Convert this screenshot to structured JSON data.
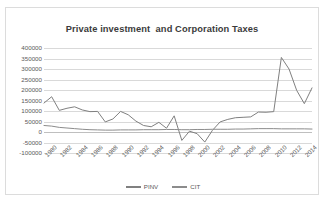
{
  "chart_data": {
    "type": "line",
    "title": "Private investment  and Corporation Taxes",
    "xlabel": "",
    "ylabel": "",
    "ylim": [
      -100000,
      400000
    ],
    "ytick_values": [
      400000,
      350000,
      300000,
      250000,
      200000,
      150000,
      100000,
      50000,
      0,
      -50000,
      -100000
    ],
    "ytick_labels": [
      "400000",
      "350000",
      "300000",
      "250000",
      "200000",
      "150000",
      "100000",
      "50000",
      "0",
      "-50000",
      "-100000"
    ],
    "grid": true,
    "legend_position": "bottom",
    "x": [
      1980,
      1981,
      1982,
      1983,
      1984,
      1985,
      1986,
      1987,
      1988,
      1989,
      1990,
      1991,
      1992,
      1993,
      1994,
      1995,
      1996,
      1997,
      1998,
      1999,
      2000,
      2001,
      2002,
      2003,
      2004,
      2005,
      2006,
      2007,
      2008,
      2009,
      2010,
      2011,
      2012,
      2013,
      2014,
      2015
    ],
    "xtick_labels": [
      "1980",
      "1982",
      "1984",
      "1986",
      "1988",
      "1990",
      "1992",
      "1994",
      "1996",
      "1998",
      "2000",
      "2002",
      "2004",
      "2006",
      "2008",
      "2010",
      "2012",
      "2014"
    ],
    "series": [
      {
        "name": "PINV",
        "color": "#808080",
        "values": [
          138000,
          168000,
          103000,
          113000,
          120000,
          105000,
          97000,
          98000,
          48000,
          62000,
          98000,
          82000,
          52000,
          31000,
          25000,
          46000,
          18000,
          77000,
          -40000,
          4000,
          -8000,
          -48000,
          8000,
          48000,
          60000,
          68000,
          70000,
          72000,
          95000,
          94000,
          97000,
          355000,
          300000,
          198000,
          135000,
          210000
        ]
      },
      {
        "name": "CIT",
        "color": "#8c8c8c",
        "values": [
          31000,
          28000,
          22000,
          19000,
          16000,
          13000,
          11000,
          10000,
          9000,
          9000,
          10000,
          10000,
          10000,
          11000,
          11000,
          11000,
          12000,
          12000,
          11000,
          11000,
          12000,
          12000,
          13000,
          13000,
          13000,
          14000,
          14000,
          15000,
          16000,
          16000,
          16000,
          15000,
          15000,
          15000,
          15000,
          14000
        ]
      }
    ]
  },
  "legend": {
    "items": [
      {
        "label": "PINV"
      },
      {
        "label": "CIT"
      }
    ]
  }
}
